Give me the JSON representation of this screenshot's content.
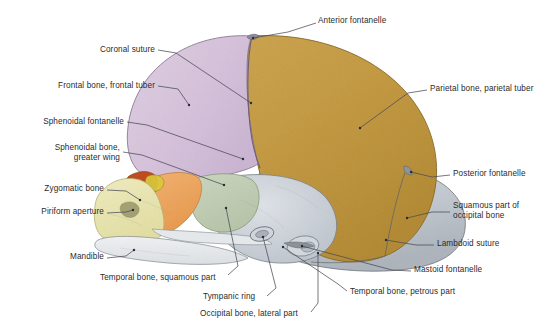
{
  "figure": {
    "background_color": "#ffffff",
    "leader_line_color": "#4a4a55",
    "label_text_color": "#2b2b2b"
  },
  "bones": [
    {
      "key": "frontal",
      "name": "Frontal bone",
      "color": "#d9c4dc"
    },
    {
      "key": "parietal",
      "name": "Parietal bone",
      "color": "#c79b43"
    },
    {
      "key": "occipital_squam",
      "name": "Squamous part of occipital bone",
      "color": "#c6cbd2"
    },
    {
      "key": "temporal_squam",
      "name": "Temporal bone, squamous part",
      "color": "#c3cfb6"
    },
    {
      "key": "sphenoid_wing",
      "name": "Sphenoidal bone, greater wing",
      "color": "#eeab63"
    },
    {
      "key": "maxilla",
      "name": "Maxilla / facial skeleton",
      "color": "#ece8b2"
    },
    {
      "key": "nasal_cavity",
      "name": "Nasal region",
      "color": "#c4491f"
    },
    {
      "key": "mandible",
      "name": "Mandible",
      "color": "#e8eaec"
    },
    {
      "key": "petrous",
      "name": "Temporal bone, petrous part",
      "color": "#c9ced4"
    }
  ],
  "labels": [
    {
      "id": "anterior-fontanelle",
      "text": "Anterior fontanelle",
      "align": "left",
      "x": 318,
      "y": 20,
      "lines": [
        "Anterior fontanelle"
      ]
    },
    {
      "id": "coronal-suture",
      "text": "Coronal suture",
      "align": "right",
      "x": 155,
      "y": 49,
      "lines": [
        "Coronal suture"
      ]
    },
    {
      "id": "frontal-bone",
      "text": "Frontal bone, frontal tuber",
      "align": "right",
      "x": 155,
      "y": 85,
      "lines": [
        "Frontal bone, frontal tuber"
      ]
    },
    {
      "id": "sphenoidal-fontanelle",
      "text": "Sphenoidal fontanelle",
      "align": "right",
      "x": 124,
      "y": 121,
      "lines": [
        "Sphenoidal fontanelle"
      ]
    },
    {
      "id": "sphenoidal-bone",
      "text": "Sphenoidal bone, greater wing",
      "align": "right",
      "x": 120,
      "y": 148,
      "lines": [
        "Sphenoidal bone,",
        "greater wing"
      ]
    },
    {
      "id": "zygomatic-bone",
      "text": "Zygomatic bone",
      "align": "right",
      "x": 104,
      "y": 188,
      "lines": [
        "Zygomatic bone"
      ]
    },
    {
      "id": "piriform-aperture",
      "text": "Piriform aperture",
      "align": "right",
      "x": 104,
      "y": 211,
      "lines": [
        "Piriform aperture"
      ]
    },
    {
      "id": "mandible",
      "text": "Mandible",
      "align": "right",
      "x": 104,
      "y": 256,
      "lines": [
        "Mandible"
      ]
    },
    {
      "id": "temporal-squamous",
      "text": "Temporal bone, squamous part",
      "align": "left",
      "x": 100,
      "y": 277,
      "lines": [
        "Temporal bone, squamous part"
      ]
    },
    {
      "id": "tympanic-ring",
      "text": "Tympanic ring",
      "align": "left",
      "x": 203,
      "y": 296,
      "lines": [
        "Tympanic ring"
      ]
    },
    {
      "id": "occipital-lateral",
      "text": "Occipital bone, lateral part",
      "align": "left",
      "x": 200,
      "y": 313,
      "lines": [
        "Occipital bone, lateral part"
      ]
    },
    {
      "id": "parietal-bone",
      "text": "Parietal bone, parietal tuber",
      "align": "left",
      "x": 430,
      "y": 88,
      "lines": [
        "Parietal bone, parietal tuber"
      ]
    },
    {
      "id": "posterior-fontanelle",
      "text": "Posterior fontanelle",
      "align": "left",
      "x": 453,
      "y": 173,
      "lines": [
        "Posterior fontanelle"
      ]
    },
    {
      "id": "occipital-squamous",
      "text": "Squamous part of occipital bone",
      "align": "left",
      "x": 453,
      "y": 205,
      "lines": [
        "Squamous part of",
        "occipital bone"
      ]
    },
    {
      "id": "lambdoid-suture",
      "text": "Lambdoid suture",
      "align": "left",
      "x": 437,
      "y": 243,
      "lines": [
        "Lambdoid suture"
      ]
    },
    {
      "id": "mastoid-fontanelle",
      "text": "Mastoid fontanelle",
      "align": "left",
      "x": 414,
      "y": 269,
      "lines": [
        "Mastoid fontanelle"
      ]
    },
    {
      "id": "temporal-petrous",
      "text": "Temporal bone, petrous part",
      "align": "left",
      "x": 350,
      "y": 291,
      "lines": [
        "Temporal bone, petrous part"
      ]
    }
  ]
}
